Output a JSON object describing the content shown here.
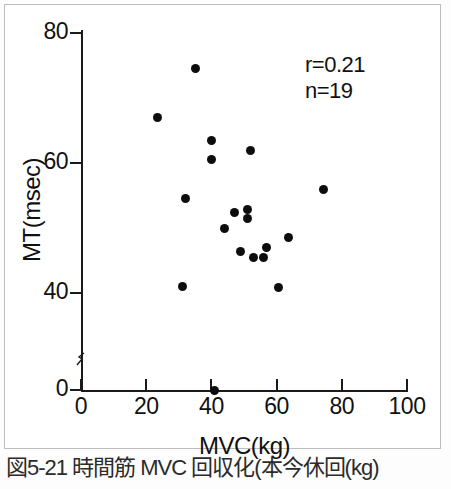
{
  "figure": {
    "caption": "図5-21 時間筋 MVC 回収化(本今休回(kg)",
    "annotation_r": "r=0.21",
    "annotation_n": "n=19"
  },
  "chart_data": {
    "type": "scatter",
    "title": "",
    "xlabel": "MVC(kg)",
    "ylabel": "MT(msec)",
    "xlim": [
      0,
      100
    ],
    "ylim": [
      0,
      80
    ],
    "xticks": [
      0,
      20,
      40,
      60,
      80,
      100
    ],
    "xtick_labels": [
      "0",
      "20",
      "40",
      "60",
      "80",
      "100"
    ],
    "yticks": [
      0,
      40,
      60,
      80
    ],
    "ytick_labels": [
      "0",
      "40",
      "60",
      "80"
    ],
    "y_axis_break": true,
    "grid": false,
    "legend": null,
    "marker": "filled-circle",
    "marker_color": "#0d0d0d",
    "n": 19,
    "r": 0.21,
    "points": [
      {
        "x": 35.0,
        "y": 74.5
      },
      {
        "x": 23.5,
        "y": 67.0
      },
      {
        "x": 40.0,
        "y": 63.5
      },
      {
        "x": 52.0,
        "y": 62.0
      },
      {
        "x": 40.0,
        "y": 60.5
      },
      {
        "x": 74.5,
        "y": 56.0
      },
      {
        "x": 32.0,
        "y": 54.5
      },
      {
        "x": 51.0,
        "y": 52.8
      },
      {
        "x": 47.0,
        "y": 52.4
      },
      {
        "x": 51.0,
        "y": 51.4
      },
      {
        "x": 44.0,
        "y": 50.0
      },
      {
        "x": 63.5,
        "y": 48.5
      },
      {
        "x": 57.0,
        "y": 47.0
      },
      {
        "x": 49.0,
        "y": 46.4
      },
      {
        "x": 53.0,
        "y": 45.5
      },
      {
        "x": 56.0,
        "y": 45.5
      },
      {
        "x": 31.0,
        "y": 41.0
      },
      {
        "x": 60.5,
        "y": 40.8
      },
      {
        "x": 41.0,
        "y": 30.0
      }
    ]
  }
}
